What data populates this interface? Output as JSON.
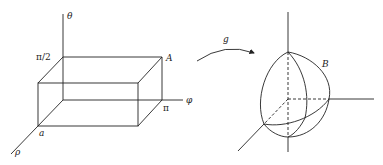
{
  "left_figure": {
    "axes": {
      "theta": "θ",
      "phi": "φ",
      "rho": "ρ"
    },
    "ticks": {
      "pi_half": "π/2",
      "pi": "π",
      "a": "a"
    },
    "corner_label": "A"
  },
  "mapping": {
    "label": "g"
  },
  "right_figure": {
    "region_label": "B"
  }
}
